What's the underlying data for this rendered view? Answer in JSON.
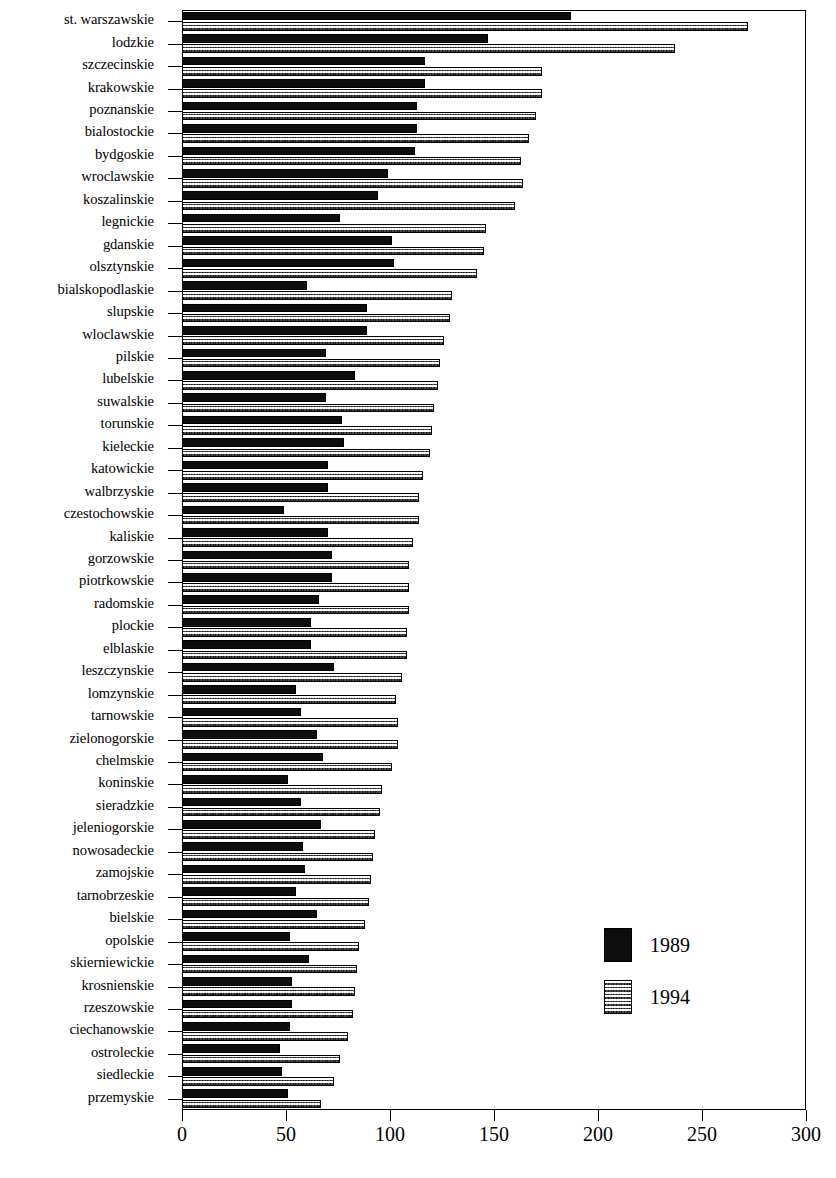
{
  "chart_data": {
    "type": "bar",
    "orientation": "horizontal",
    "title": "",
    "subtitle": "",
    "xlabel": "",
    "ylabel": "",
    "xlim": [
      0,
      300
    ],
    "xticks": [
      0,
      50,
      100,
      150,
      200,
      250,
      300
    ],
    "xtick_labels": [
      "0",
      "50",
      "100",
      "150",
      "200",
      "250",
      "300"
    ],
    "grid": false,
    "legend_position": "inside-right-lower",
    "colors": {
      "series_1989": "#0d0d0d",
      "series_1994": "#b9b9b9",
      "axis": "#000000",
      "background": "#ffffff"
    },
    "categories": [
      "st. warszawskie",
      "lodzkie",
      "szczecinskie",
      "krakowskie",
      "poznanskie",
      "bialostockie",
      "bydgoskie",
      "wroclawskie",
      "koszalinskie",
      "legnickie",
      "gdanskie",
      "olsztynskie",
      "bialskopodlaskie",
      "slupskie",
      "wloclawskie",
      "pilskie",
      "lubelskie",
      "suwalskie",
      "torunskie",
      "kieleckie",
      "katowickie",
      "walbrzyskie",
      "czestochowskie",
      "kaliskie",
      "gorzowskie",
      "piotrkowskie",
      "radomskie",
      "plockie",
      "elblaskie",
      "leszczynskie",
      "lomzynskie",
      "tarnowskie",
      "zielonogorskie",
      "chelmskie",
      "koninskie",
      "sieradzkie",
      "jeleniogorskie",
      "nowosadeckie",
      "zamojskie",
      "tarnobrzeskie",
      "bielskie",
      "opolskie",
      "skierniewickie",
      "krosnienskie",
      "rzeszowskie",
      "ciechanowskie",
      "ostroleckie",
      "siedleckie",
      "przemyskie"
    ],
    "series": [
      {
        "name": "1989",
        "values": [
          187,
          147,
          117,
          117,
          113,
          113,
          112,
          99,
          94,
          76,
          101,
          102,
          60,
          89,
          89,
          69,
          83,
          69,
          77,
          78,
          70,
          70,
          49,
          70,
          72,
          72,
          66,
          62,
          62,
          73,
          55,
          57,
          65,
          68,
          51,
          57,
          67,
          58,
          59,
          55,
          65,
          52,
          61,
          53,
          53,
          52,
          47,
          48,
          51
        ]
      },
      {
        "name": "1994",
        "values": [
          272,
          237,
          173,
          173,
          170,
          167,
          163,
          164,
          160,
          146,
          145,
          142,
          130,
          129,
          126,
          124,
          123,
          121,
          120,
          119,
          116,
          114,
          114,
          111,
          109,
          109,
          109,
          108,
          108,
          106,
          103,
          104,
          104,
          101,
          96,
          95,
          93,
          92,
          91,
          90,
          88,
          85,
          84,
          83,
          82,
          80,
          76,
          73,
          67
        ]
      }
    ],
    "legend": [
      {
        "label": "1989",
        "swatch": "solid-black"
      },
      {
        "label": "1994",
        "swatch": "stippled-gray"
      }
    ]
  }
}
